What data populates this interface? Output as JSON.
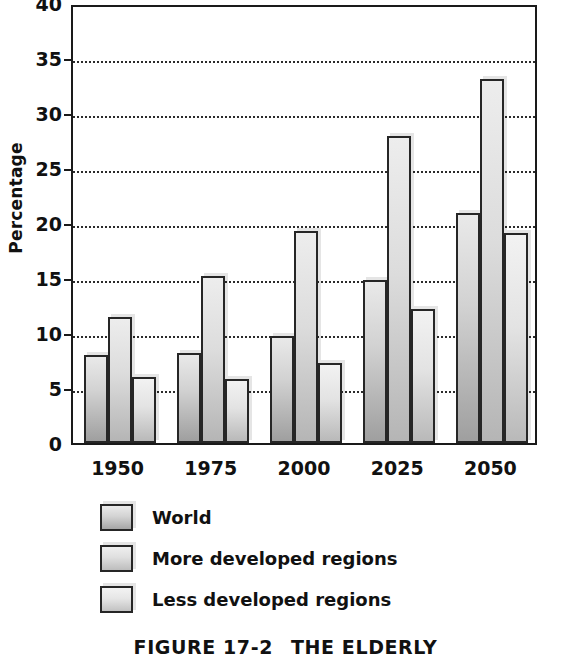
{
  "chart_data": {
    "type": "bar",
    "title": "",
    "xlabel": "",
    "ylabel": "Percentage",
    "ylim": [
      0,
      40
    ],
    "ytick_step": 5,
    "grid": true,
    "grid_style": "dotted-horizontal",
    "legend_position": "below-plot-left",
    "categories": [
      "1950",
      "1975",
      "2000",
      "2025",
      "2050"
    ],
    "series": [
      {
        "name": "World",
        "values": [
          8.0,
          8.2,
          9.7,
          14.8,
          20.9
        ]
      },
      {
        "name": "More developed regions",
        "values": [
          11.5,
          15.2,
          19.3,
          27.9,
          33.1
        ]
      },
      {
        "name": "Less developed regions",
        "values": [
          6.0,
          5.8,
          7.3,
          12.2,
          19.1
        ]
      }
    ],
    "yticks": [
      "0",
      "5",
      "10",
      "15",
      "20",
      "25",
      "30",
      "35",
      "40"
    ]
  },
  "axis": {
    "y_title": "Percentage",
    "y_tick_labels": [
      "40",
      "35",
      "30",
      "25",
      "20",
      "15",
      "10",
      "5",
      "0"
    ],
    "x_tick_labels": [
      "1950",
      "1975",
      "2000",
      "2025",
      "2050"
    ]
  },
  "legend": {
    "items": [
      {
        "label": "World"
      },
      {
        "label": "More developed regions"
      },
      {
        "label": "Less developed regions"
      }
    ]
  },
  "caption": {
    "figure_number": "FIGURE 17-2",
    "figure_title": "THE ELDERLY"
  },
  "colors": {
    "bar_border": "#262626",
    "axis": "#1a1a1a",
    "grid": "#2b2b2b",
    "text": "#111111",
    "background": "#ffffff"
  }
}
